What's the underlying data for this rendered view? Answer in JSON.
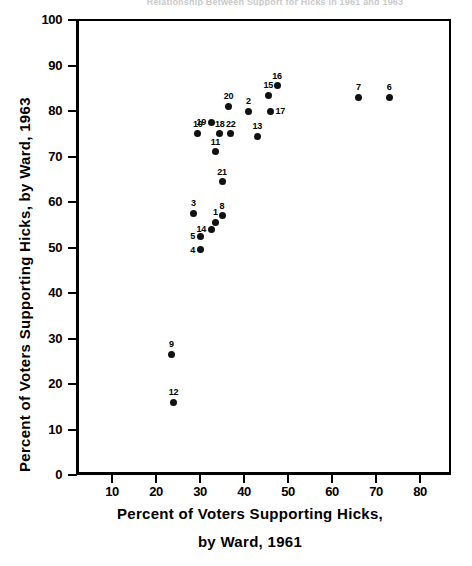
{
  "figure": {
    "title": "Relationship Between Support for Hicks in 1961 and 1963",
    "y_axis_title": "Percent of Voters Supporting Hicks, by Ward, 1963",
    "x_axis_title_line1": "Percent of  Voters Supporting  Hicks,",
    "x_axis_title_line2": "by  Ward,  1961"
  },
  "chart_data": {
    "type": "scatter",
    "title": "Relationship Between Support for Hicks in 1961 and 1963",
    "xlabel": "Percent of Voters Supporting Hicks, by Ward, 1961",
    "ylabel": "Percent of Voters Supporting Hicks, by Ward, 1963",
    "xlim": [
      0,
      85
    ],
    "ylim": [
      0,
      100
    ],
    "xticks": [
      10,
      20,
      30,
      40,
      50,
      60,
      70,
      80
    ],
    "yticks": [
      0,
      10,
      20,
      30,
      40,
      50,
      60,
      70,
      80,
      90,
      100
    ],
    "grid": false,
    "legend": "none",
    "point_label_field": "ward",
    "points": [
      {
        "ward": "1",
        "x": 33.5,
        "y": 55.5,
        "label_pos": "above"
      },
      {
        "ward": "2",
        "x": 41.0,
        "y": 80.0,
        "label_pos": "above"
      },
      {
        "ward": "3",
        "x": 28.5,
        "y": 57.5,
        "label_pos": "above"
      },
      {
        "ward": "4",
        "x": 30.0,
        "y": 49.5,
        "label_pos": "left"
      },
      {
        "ward": "5",
        "x": 30.0,
        "y": 52.5,
        "label_pos": "left"
      },
      {
        "ward": "6",
        "x": 73.0,
        "y": 83.0,
        "label_pos": "above"
      },
      {
        "ward": "7",
        "x": 66.0,
        "y": 83.0,
        "label_pos": "above"
      },
      {
        "ward": "8",
        "x": 35.0,
        "y": 57.0,
        "label_pos": "above"
      },
      {
        "ward": "9",
        "x": 23.5,
        "y": 26.5,
        "label_pos": "above"
      },
      {
        "ward": "10",
        "x": 29.5,
        "y": 75.0,
        "label_pos": "above"
      },
      {
        "ward": "11",
        "x": 33.5,
        "y": 71.0,
        "label_pos": "above"
      },
      {
        "ward": "12",
        "x": 24.0,
        "y": 16.0,
        "label_pos": "above"
      },
      {
        "ward": "13",
        "x": 43.0,
        "y": 74.5,
        "label_pos": "above"
      },
      {
        "ward": "14",
        "x": 32.5,
        "y": 54.0,
        "label_pos": "left"
      },
      {
        "ward": "15",
        "x": 45.5,
        "y": 83.5,
        "label_pos": "above"
      },
      {
        "ward": "16",
        "x": 47.5,
        "y": 85.5,
        "label_pos": "above"
      },
      {
        "ward": "17",
        "x": 46.0,
        "y": 80.0,
        "label_pos": "right"
      },
      {
        "ward": "18",
        "x": 34.5,
        "y": 75.0,
        "label_pos": "above"
      },
      {
        "ward": "19",
        "x": 32.5,
        "y": 77.5,
        "label_pos": "left"
      },
      {
        "ward": "20",
        "x": 36.5,
        "y": 81.0,
        "label_pos": "above"
      },
      {
        "ward": "21",
        "x": 35.0,
        "y": 64.5,
        "label_pos": "above"
      },
      {
        "ward": "22",
        "x": 37.0,
        "y": 75.0,
        "label_pos": "above"
      }
    ]
  }
}
